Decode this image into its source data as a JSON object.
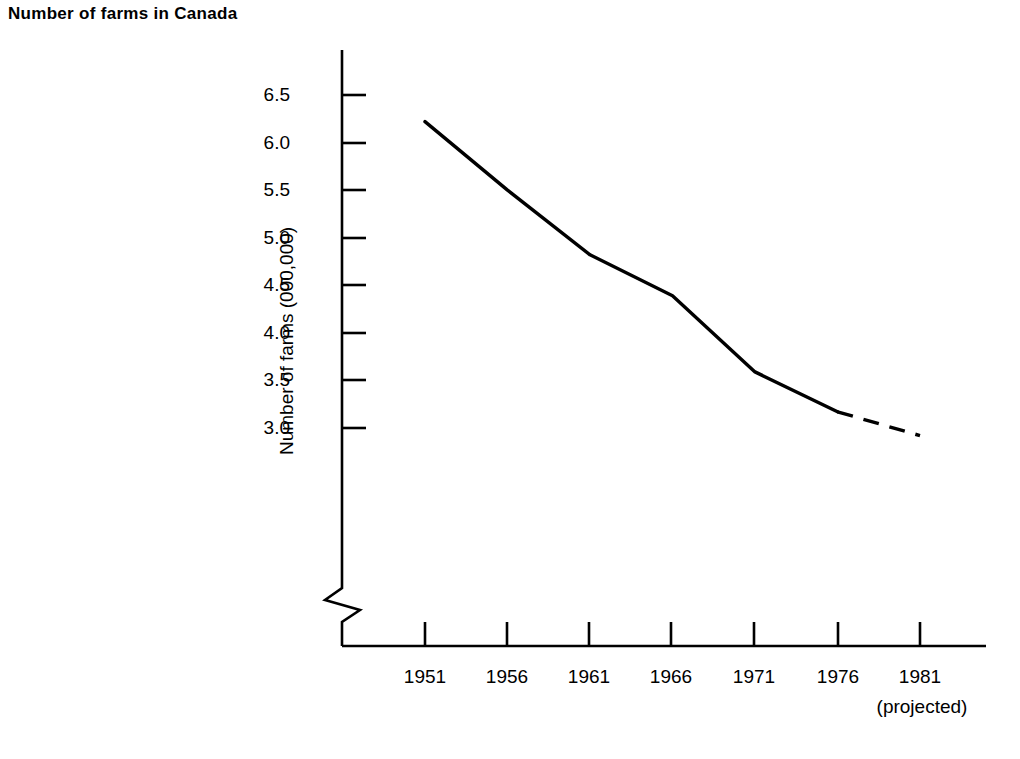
{
  "chart_data": {
    "type": "line",
    "title": "Number of farms in Canada",
    "xlabel": "",
    "ylabel": "Number of farms (000,000)",
    "x": [
      1951,
      1956,
      1961,
      1966,
      1971,
      1976,
      1981
    ],
    "x_tick_labels": [
      "1951",
      "1956",
      "1961",
      "1966",
      "1971",
      "1976",
      "1981"
    ],
    "x_tick_sublabel": "(projected)",
    "values": [
      6.22,
      5.5,
      4.82,
      4.39,
      3.59,
      3.17,
      2.92
    ],
    "y_tick_labels": [
      "6.5",
      "6.0",
      "5.5",
      "5.0",
      "4.5",
      "4.0",
      "3.5",
      "3.0"
    ],
    "y_tick_values": [
      6.5,
      6.0,
      5.5,
      5.0,
      4.5,
      4.0,
      3.5,
      3.0
    ],
    "ylim": [
      3.0,
      6.5
    ],
    "xlim": [
      1951,
      1981
    ],
    "grid": false,
    "legend": "none",
    "axis_break": true,
    "axis_break_note": "zigzag break on y-axis below 3.0",
    "series": [
      {
        "name": "Number of farms (000,000)",
        "style": "solid",
        "points": [
          {
            "x": 1951,
            "y": 6.22
          },
          {
            "x": 1956,
            "y": 5.5
          },
          {
            "x": 1961,
            "y": 4.82
          },
          {
            "x": 1966,
            "y": 4.39
          },
          {
            "x": 1971,
            "y": 3.59
          },
          {
            "x": 1976,
            "y": 3.17
          }
        ]
      },
      {
        "name": "Projected",
        "style": "dashed",
        "points": [
          {
            "x": 1976,
            "y": 3.17
          },
          {
            "x": 1981,
            "y": 2.92
          }
        ]
      }
    ],
    "colors": {
      "line": "#000000",
      "axis": "#000000",
      "background": "#ffffff"
    }
  }
}
